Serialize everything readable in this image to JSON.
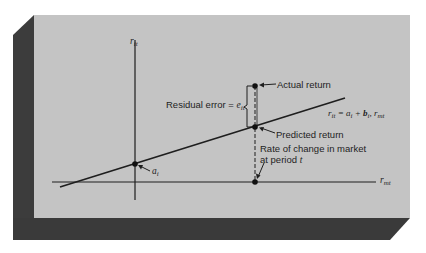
{
  "figure": {
    "panel_color": "#c3c3c3",
    "shadow_color": "#3a3a3a",
    "ink_color": "#1e1e1e"
  },
  "axes": {
    "y_axis_label": "r",
    "y_axis_sub": "it",
    "x_axis_label": "r",
    "x_axis_sub": "mt"
  },
  "labels": {
    "actual_return": "Actual return",
    "predicted_return": "Predicted return",
    "residual_prefix": "Residual error = ",
    "residual_var": "e",
    "residual_sub": "it",
    "intercept_var": "a",
    "intercept_sub": "i",
    "market_line1": "Rate of change in market",
    "market_line2_prefix": "at period ",
    "market_line2_var": "t",
    "equation_r": "r",
    "equation_r_sub": "it",
    "equation_eq": " = ",
    "equation_a": "a",
    "equation_a_sub": "i",
    "equation_plus": " + ",
    "equation_b": "b",
    "equation_b_sub": "i",
    "equation_comma": ", ",
    "equation_rm": "r",
    "equation_rm_sub": "mt"
  },
  "points": [
    {
      "name": "intercept",
      "x": 135,
      "y": 164
    },
    {
      "name": "predicted",
      "x": 255,
      "y": 127
    },
    {
      "name": "actual",
      "x": 255,
      "y": 86
    },
    {
      "name": "market",
      "x": 255,
      "y": 182
    }
  ]
}
